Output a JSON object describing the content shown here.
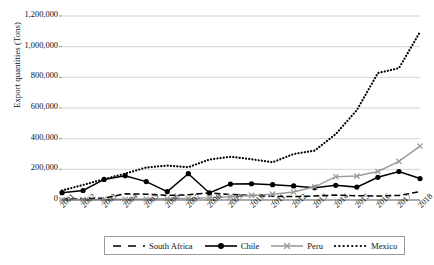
{
  "chart_data": {
    "type": "line",
    "title": "",
    "xlabel": "",
    "ylabel": "Export quantities (Tons)",
    "x": [
      "2001",
      "2002",
      "2003",
      "2004",
      "2005",
      "2006",
      "2007",
      "2008",
      "2009",
      "2010",
      "2011",
      "2012",
      "2013",
      "2014",
      "2015",
      "2016",
      "2017",
      "2018"
    ],
    "ylim": [
      0,
      1200000
    ],
    "ytick_values": [
      0,
      200000,
      400000,
      600000,
      800000,
      1000000,
      1200000
    ],
    "ytick_labels": [
      "0",
      "200,000",
      "400,000",
      "600,000",
      "800,000",
      "1,000,000",
      "1,200,000"
    ],
    "grid": "horizontal",
    "legend_position": "bottom",
    "series": [
      {
        "name": "South Africa",
        "color": "#000000",
        "style": "dashed",
        "marker": "none",
        "values": [
          5000,
          8000,
          12000,
          40000,
          38000,
          30000,
          34000,
          46000,
          36000,
          30000,
          24000,
          22000,
          26000,
          32000,
          28000,
          26000,
          30000,
          54000
        ]
      },
      {
        "name": "Chile",
        "color": "#000000",
        "style": "solid",
        "marker": "circle",
        "values": [
          48000,
          62000,
          134000,
          158000,
          120000,
          55000,
          172000,
          46000,
          104000,
          106000,
          100000,
          92000,
          80000,
          96000,
          84000,
          148000,
          186000,
          140000
        ]
      },
      {
        "name": "Peru",
        "color": "#9c9c9c",
        "style": "solid",
        "marker": "x",
        "values": [
          2000,
          3000,
          4000,
          5000,
          6000,
          8000,
          10000,
          14000,
          22000,
          30000,
          38000,
          52000,
          86000,
          152000,
          156000,
          186000,
          252000,
          352000
        ]
      },
      {
        "name": "Mexico",
        "color": "#000000",
        "style": "dotted",
        "marker": "none",
        "values": [
          62000,
          98000,
          136000,
          172000,
          212000,
          224000,
          214000,
          264000,
          282000,
          266000,
          246000,
          300000,
          322000,
          430000,
          586000,
          828000,
          860000,
          1096000
        ]
      }
    ]
  },
  "legend": {
    "entries": [
      {
        "label": "South Africa"
      },
      {
        "label": "Chile"
      },
      {
        "label": "Peru"
      },
      {
        "label": "Mexico"
      }
    ]
  }
}
